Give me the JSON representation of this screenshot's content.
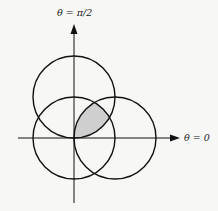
{
  "diagram": {
    "labels": {
      "vertical_axis": "θ = π/2",
      "horizontal_axis": "θ = 0"
    },
    "origin": {
      "x": 74,
      "y": 138
    },
    "radius": 41,
    "circles": [
      {
        "name": "circle-centered-origin",
        "cx": 74,
        "cy": 138
      },
      {
        "name": "circle-upper",
        "cx": 74,
        "cy": 97
      },
      {
        "name": "circle-right",
        "cx": 115,
        "cy": 138
      }
    ],
    "shaded_region": "intersection of all three circles",
    "colors": {
      "stroke": "#111111",
      "shade": "#cfcfcf",
      "background": "#f7f7f6"
    }
  }
}
